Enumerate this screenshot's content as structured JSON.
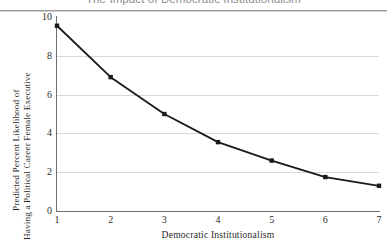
{
  "chart_data": {
    "type": "line",
    "title": "The Impact of Democratic Institutionalism",
    "xlabel": "Democratic Institutionalism",
    "ylabel_line1": "Predicted Percent Likelihood of",
    "ylabel_line2": "Having a Political Career Female Executive",
    "x": [
      1,
      2,
      3,
      4,
      5,
      6,
      7
    ],
    "values": [
      9.55,
      6.9,
      5.0,
      3.55,
      2.6,
      1.75,
      1.3
    ],
    "xtick_labels": [
      "1",
      "2",
      "3",
      "4",
      "5",
      "6",
      "7"
    ],
    "ytick_labels": [
      "0",
      "2",
      "4",
      "6",
      "8",
      "10"
    ],
    "ytick_values": [
      0,
      2,
      4,
      6,
      8,
      10
    ],
    "xlim": [
      1,
      7
    ],
    "ylim": [
      0,
      10
    ],
    "grid": "horizontal",
    "legend": "none",
    "marker": "square",
    "series_color": "#1a1a1a",
    "gridline_color": "#d8d8d8",
    "axis_color": "#6e6e6e",
    "title_color": "#8d8d8d"
  }
}
